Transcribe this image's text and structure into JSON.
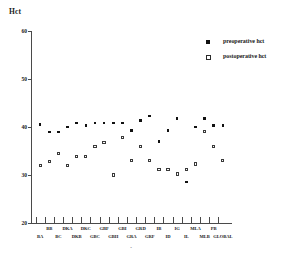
{
  "chart_data": {
    "type": "scatter",
    "title": "",
    "ylabel": "Hct",
    "xlabel": "",
    "ylim": [
      20,
      60
    ],
    "yticks": [
      60,
      50,
      40,
      30,
      20
    ],
    "ytick_labels": [
      "60",
      "50",
      "40",
      "30",
      "20"
    ],
    "grid": false,
    "legend_position": "top-right",
    "categories": [
      "BA",
      "BB",
      "BC",
      "DKA",
      "DKB",
      "DKC",
      "GBC",
      "GBF",
      "GBH",
      "GBI",
      "GRA",
      "GRD",
      "GRF",
      "IB",
      "ID",
      "IG",
      "IL",
      "MLA",
      "MLB",
      "PB",
      "GLOBAL"
    ],
    "series": [
      {
        "name": "preoperative hct",
        "marker": "filled-square",
        "values": [
          40.5,
          39.0,
          39.0,
          40.0,
          40.8,
          40.3,
          40.8,
          40.8,
          40.8,
          40.8,
          39.3,
          41.3,
          42.3,
          37.0,
          39.3,
          41.8,
          28.5,
          40.0,
          41.8,
          40.3,
          40.3
        ]
      },
      {
        "name": "postoperative hct",
        "marker": "open-square",
        "values": [
          32.0,
          32.8,
          34.5,
          32.0,
          33.8,
          33.8,
          36.0,
          36.8,
          30.0,
          37.8,
          33.0,
          36.0,
          33.0,
          31.2,
          31.2,
          30.2,
          31.2,
          32.3,
          39.0,
          36.0,
          33.0
        ]
      }
    ]
  },
  "axis": {
    "y_title": "Hct",
    "x_caption": "-"
  },
  "legend": {
    "items": [
      {
        "label": "preoperative hct",
        "marker": "filled-square-marker"
      },
      {
        "label": "postoperative hct",
        "marker": "open-square-marker"
      }
    ]
  }
}
